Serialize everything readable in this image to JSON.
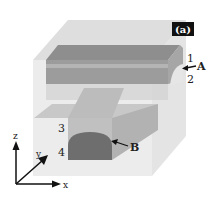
{
  "figure": {
    "panel_label": "(a)",
    "layer_labels": [
      "1",
      "2",
      "3",
      "4"
    ],
    "pointer_labels": [
      "A",
      "B"
    ],
    "axes": {
      "x": "x",
      "y": "y",
      "z": "z"
    }
  },
  "colors": {
    "background": "#ffffff",
    "outer_box_top": "#dcdcdc",
    "outer_box_front": "#ebebeb",
    "outer_box_side": "#e2e2e2",
    "slab_top": "#8c8c8c",
    "slab_front": "#9a9a9a",
    "slab_band": "#a9a9a9",
    "branch_top": "#c4c4c4",
    "branch_front": "#bdbdbd",
    "branch_side": "#b0b0b0",
    "core_dark": "#6e6e6e",
    "panel_label_bg": "#111111",
    "text": "#222222"
  }
}
